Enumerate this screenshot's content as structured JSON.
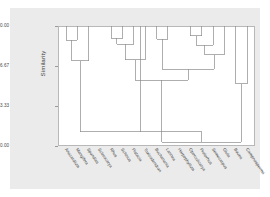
{
  "chart_data": {
    "type": "dendrogram",
    "title": "",
    "xlabel": "",
    "ylabel": "Similarity",
    "ylim": [
      0.0,
      100.0
    ],
    "y_axis_inverted": true,
    "grid": false,
    "legend": "none",
    "yticks": [
      "0.00",
      "33.33",
      "66.67",
      "100.00"
    ],
    "ytick_values": [
      0.0,
      33.33,
      66.67,
      100.0
    ],
    "categories": [
      "Anacardium",
      "Mangifera",
      "Spondias",
      "Sclerocarya",
      "Rhus",
      "Schinus",
      "Pistacia",
      "Toxicodendron",
      "Buchanania",
      "Lannea",
      "Harpephyllum",
      "Operculicarya",
      "Protorhus",
      "Semecarpus",
      "Gluta",
      "Bouea",
      "Campnosperma"
    ],
    "leaf_count": 17,
    "merges": [
      {
        "id": "m1",
        "children": [
          "Anacardium",
          "Mangifera"
        ],
        "similarity": 88.0
      },
      {
        "id": "m2",
        "children": [
          "m1",
          "Spondias"
        ],
        "similarity": 71.0
      },
      {
        "id": "m3",
        "children": [
          "Rhus",
          "Schinus"
        ],
        "similarity": 90.0
      },
      {
        "id": "m4",
        "children": [
          "m3",
          "Pistacia"
        ],
        "similarity": 85.0
      },
      {
        "id": "m5",
        "children": [
          "m4",
          "Toxicodendron"
        ],
        "similarity": 72.0
      },
      {
        "id": "m6",
        "children": [
          "Buchanania",
          "Lannea"
        ],
        "similarity": 89.0
      },
      {
        "id": "m7",
        "children": [
          "Operculicarya",
          "Protorhus"
        ],
        "similarity": 92.0
      },
      {
        "id": "m8",
        "children": [
          "m7",
          "Semecarpus"
        ],
        "similarity": 84.0
      },
      {
        "id": "m9",
        "children": [
          "m8",
          "Gluta"
        ],
        "similarity": 76.0
      },
      {
        "id": "m10",
        "children": [
          "m6",
          "m9"
        ],
        "similarity": 64.0
      },
      {
        "id": "m11",
        "children": [
          "m5",
          "m10"
        ],
        "similarity": 55.0
      },
      {
        "id": "m12",
        "children": [
          "Bouea",
          "Campnosperma"
        ],
        "similarity": 52.0
      },
      {
        "id": "m13",
        "children": [
          "m11",
          "m12"
        ],
        "similarity": 3.0
      },
      {
        "id": "m14",
        "children": [
          "m2",
          "m13"
        ],
        "similarity": 12.0
      }
    ],
    "colors": {
      "line": "#8c8c8c",
      "panel_background": "#ffffff",
      "figure_background": "#ebebeb",
      "axis": "#b8b8b8",
      "text": "#3d3d3d"
    }
  }
}
